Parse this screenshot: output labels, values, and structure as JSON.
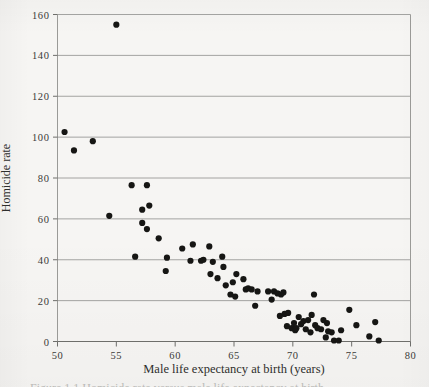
{
  "figure": {
    "paper_color": "#f6f5f3",
    "ink_color": "#1c1c1a",
    "grid_color": "#9a9a97",
    "point_color": "#161614",
    "caption_partial": "Figure 1.1  Homicide rate versus male life expectancy at birth"
  },
  "axes": {
    "ylabel": "Homicide rate",
    "xlabel": "Male life expectancy at birth (years)",
    "y_ticks": [
      "160",
      "140",
      "120",
      "100",
      "80",
      "60",
      "40",
      "20",
      "0"
    ],
    "x_ticks": [
      "50",
      "55",
      "60",
      "65",
      "70",
      "75",
      "80"
    ]
  },
  "chart_data": {
    "type": "scatter",
    "title": "",
    "xlabel": "Male life expectancy at birth (years)",
    "ylabel": "Homicide rate",
    "xlim": [
      50,
      80
    ],
    "ylim": [
      0,
      160
    ],
    "xticks": [
      50,
      55,
      60,
      65,
      70,
      75,
      80
    ],
    "yticks": [
      0,
      20,
      40,
      60,
      80,
      100,
      120,
      140,
      160
    ],
    "grid": "horizontal",
    "legend": "none",
    "marker": "filled-circle",
    "points": [
      [
        50.6,
        102.5
      ],
      [
        51.4,
        93.5
      ],
      [
        53.0,
        98.0
      ],
      [
        55.0,
        155.0
      ],
      [
        54.4,
        61.5
      ],
      [
        56.3,
        76.5
      ],
      [
        57.6,
        76.5
      ],
      [
        57.2,
        64.5
      ],
      [
        57.8,
        66.5
      ],
      [
        57.2,
        58.0
      ],
      [
        57.6,
        55.0
      ],
      [
        59.3,
        41.0
      ],
      [
        56.6,
        41.5
      ],
      [
        58.6,
        50.5
      ],
      [
        59.2,
        34.5
      ],
      [
        60.6,
        45.5
      ],
      [
        61.3,
        39.5
      ],
      [
        61.5,
        47.5
      ],
      [
        62.2,
        39.5
      ],
      [
        62.4,
        40.0
      ],
      [
        63.0,
        33.0
      ],
      [
        63.2,
        39.0
      ],
      [
        62.9,
        46.5
      ],
      [
        63.6,
        31.0
      ],
      [
        64.0,
        41.5
      ],
      [
        64.1,
        36.5
      ],
      [
        64.3,
        27.5
      ],
      [
        64.7,
        23.0
      ],
      [
        64.9,
        29.0
      ],
      [
        65.1,
        22.0
      ],
      [
        65.2,
        33.0
      ],
      [
        65.8,
        30.5
      ],
      [
        66.0,
        25.5
      ],
      [
        66.2,
        26.0
      ],
      [
        66.8,
        17.5
      ],
      [
        66.5,
        25.5
      ],
      [
        67.0,
        24.5
      ],
      [
        67.9,
        24.5
      ],
      [
        68.2,
        20.5
      ],
      [
        68.4,
        24.5
      ],
      [
        68.7,
        23.5
      ],
      [
        68.9,
        12.5
      ],
      [
        69.0,
        23.0
      ],
      [
        69.2,
        24.0
      ],
      [
        69.3,
        13.5
      ],
      [
        69.5,
        7.5
      ],
      [
        69.6,
        14.0
      ],
      [
        69.9,
        6.5
      ],
      [
        70.1,
        9.0
      ],
      [
        70.2,
        5.5
      ],
      [
        70.3,
        6.5
      ],
      [
        70.5,
        12.0
      ],
      [
        70.7,
        8.5
      ],
      [
        70.9,
        10.0
      ],
      [
        71.1,
        6.0
      ],
      [
        71.3,
        10.5
      ],
      [
        71.5,
        4.5
      ],
      [
        71.6,
        13.0
      ],
      [
        71.8,
        23.0
      ],
      [
        71.9,
        8.0
      ],
      [
        72.1,
        6.5
      ],
      [
        72.4,
        6.0
      ],
      [
        72.6,
        10.5
      ],
      [
        72.8,
        2.0
      ],
      [
        72.9,
        9.0
      ],
      [
        73.0,
        5.0
      ],
      [
        73.3,
        4.5
      ],
      [
        73.5,
        0.5
      ],
      [
        73.9,
        0.5
      ],
      [
        74.1,
        5.5
      ],
      [
        74.8,
        15.5
      ],
      [
        75.4,
        8.0
      ],
      [
        76.5,
        2.5
      ],
      [
        77.0,
        9.5
      ],
      [
        77.3,
        0.5
      ]
    ]
  }
}
